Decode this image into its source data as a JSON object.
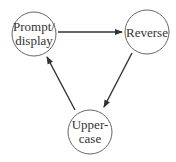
{
  "diagram": {
    "type": "state-cycle",
    "nodes": [
      {
        "id": "prompt",
        "lines": [
          "Prompt/",
          "display"
        ],
        "cx": 34,
        "cy": 34,
        "r": 22
      },
      {
        "id": "reverse",
        "lines": [
          "Reverse"
        ],
        "cx": 147,
        "cy": 32,
        "r": 22
      },
      {
        "id": "upper",
        "lines": [
          "Upper-",
          "case"
        ],
        "cx": 90,
        "cy": 132,
        "r": 22
      }
    ],
    "edges": [
      {
        "from": "prompt",
        "to": "reverse"
      },
      {
        "from": "reverse",
        "to": "upper"
      },
      {
        "from": "upper",
        "to": "prompt"
      }
    ],
    "colors": {
      "stroke": "#555555",
      "arrow": "#333333",
      "text": "#333333"
    }
  }
}
